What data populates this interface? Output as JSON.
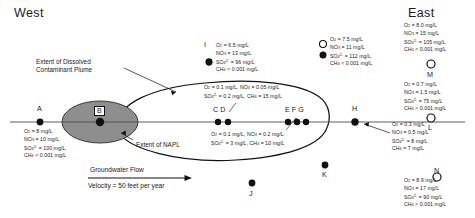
{
  "orientation": {
    "west": "West",
    "east": "East"
  },
  "annotations": {
    "plume_extent_line1": "Extent of Dissolved",
    "plume_extent_line2": "Contaminant Plume",
    "napl_extent": "Extent of NAPL",
    "flow_label": "Groundwater Flow",
    "velocity_label": "Velocity = 50 feet per year"
  },
  "points": {
    "a": "A",
    "b": "B",
    "cd": "C D",
    "efg": "E F G",
    "h": "H",
    "i": "I",
    "j": "J",
    "k": "K",
    "l": "L",
    "m": "M",
    "n": "N"
  },
  "chem_a": {
    "o2": "O",
    "o2_sub": "2",
    "o2_val": " = 8 mg/L",
    "no3": "NO",
    "no3_sub": "3",
    "no3_val": " = 10 mg/L",
    "so4": "SO",
    "so4_sub": "4",
    "so4_sup": "2-",
    "so4_val": " = 100 mg/L",
    "ch4": "CH",
    "ch4_sub": "4",
    "ch4_val": " < 0.001 mg/L"
  },
  "chem_i": {
    "o2": "O",
    "o2_sub": "2",
    "o2_val": " = 6.5 mg/L",
    "no3": "NO",
    "no3_sub": "3",
    "no3_val": " = 13 mg/L",
    "so4": "SO",
    "so4_sub": "4",
    "so4_sup": "2-",
    "so4_val": " = 96 mg/L",
    "ch4": "CH",
    "ch4_sub": "4",
    "ch4_val": " < 0.001 mg/L"
  },
  "chem_cd": {
    "line1_a": "O",
    "line1_a_sub": "2",
    "line1_a_val": " = 0.1 mg/L,  ",
    "line1_b": "NO",
    "line1_b_sub": "3",
    "line1_b_val": " = 0.05 mg/L",
    "line2_a": "SO",
    "line2_a_sub": "4",
    "line2_a_sup": "2-",
    "line2_a_val": " = 0.2 mg/L,  ",
    "line2_b": "CH",
    "line2_b_sub": "4",
    "line2_b_val": " = 15 mg/L"
  },
  "chem_efg": {
    "line1_a": "O",
    "line1_a_sub": "2",
    "line1_a_val": " = 0.1 mg/L,  ",
    "line1_b": "NO",
    "line1_b_sub": "3",
    "line1_b_val": " = 0.2 mg/L",
    "line2_a": "SO",
    "line2_a_sub": "4",
    "line2_a_sup": "2-",
    "line2_a_val": " = 3 mg/L,  ",
    "line2_b": "CH",
    "line2_b_sub": "4",
    "line2_b_val": " = 10 mg/L"
  },
  "chem_top_pair": {
    "o2": "O",
    "o2_sub": "2",
    "o2_val": " = 7.5 mg/L",
    "no3": "NO",
    "no3_sub": "3",
    "no3_val": " = 11 mg/L",
    "so4": "SO",
    "so4_sub": "4",
    "so4_sup": "2-",
    "so4_val": " = 112 mg/L",
    "ch4": "CH",
    "ch4_sub": "4",
    "ch4_val": " < 0.001 mg/L"
  },
  "chem_east_top": {
    "o2": "O",
    "o2_sub": "2",
    "o2_val": " = 8.0 mg/L",
    "no3": "NO",
    "no3_sub": "3",
    "no3_val": " = 15 mg/L",
    "so4": "SO",
    "so4_sub": "4",
    "so4_sup": "2-",
    "so4_val": " = 105 mg/L",
    "ch4": "CH",
    "ch4_sub": "4",
    "ch4_val": " < 0.001 mg/L"
  },
  "chem_m": {
    "o2": "O",
    "o2_sub": "2",
    "o2_val": " = 0.7 mg/L",
    "no3": "NO",
    "no3_sub": "3",
    "no3_val": " = 1.5 mg/L",
    "so4": "SO",
    "so4_sub": "4",
    "so4_sup": "2-",
    "so4_val": " = 75 mg/L",
    "ch4": "CH",
    "ch4_sub": "4",
    "ch4_val": " < 0.001 mg/L"
  },
  "chem_h": {
    "o2": "O",
    "o2_sub": "2",
    "o2_val": " = 0.3 mg/L",
    "no3": "NO",
    "no3_sub": "3",
    "no3_val": " = 0.5 mg/L",
    "so4": "SO",
    "so4_sub": "4",
    "so4_sup": "2-",
    "so4_val": " = 8 mg/L",
    "ch4": "CH",
    "ch4_sub": "4",
    "ch4_val": " = 7 mg/L"
  },
  "chem_n": {
    "o2": "O",
    "o2_sub": "2",
    "o2_val": " = 8.9 mg/L",
    "no3": "NO",
    "no3_sub": "3",
    "no3_val": " = 17 mg/L",
    "so4": "SO",
    "so4_sub": "4",
    "so4_sup": "2-",
    "so4_val": " = 90 mg/L",
    "ch4": "CH",
    "ch4_sub": "4",
    "ch4_val": " < 0.001 mg/L"
  },
  "colors": {
    "napl_fill": "#8e8e8e",
    "plume_stroke": "#111111",
    "point_fill": "#111111",
    "background": "#ffffff"
  }
}
